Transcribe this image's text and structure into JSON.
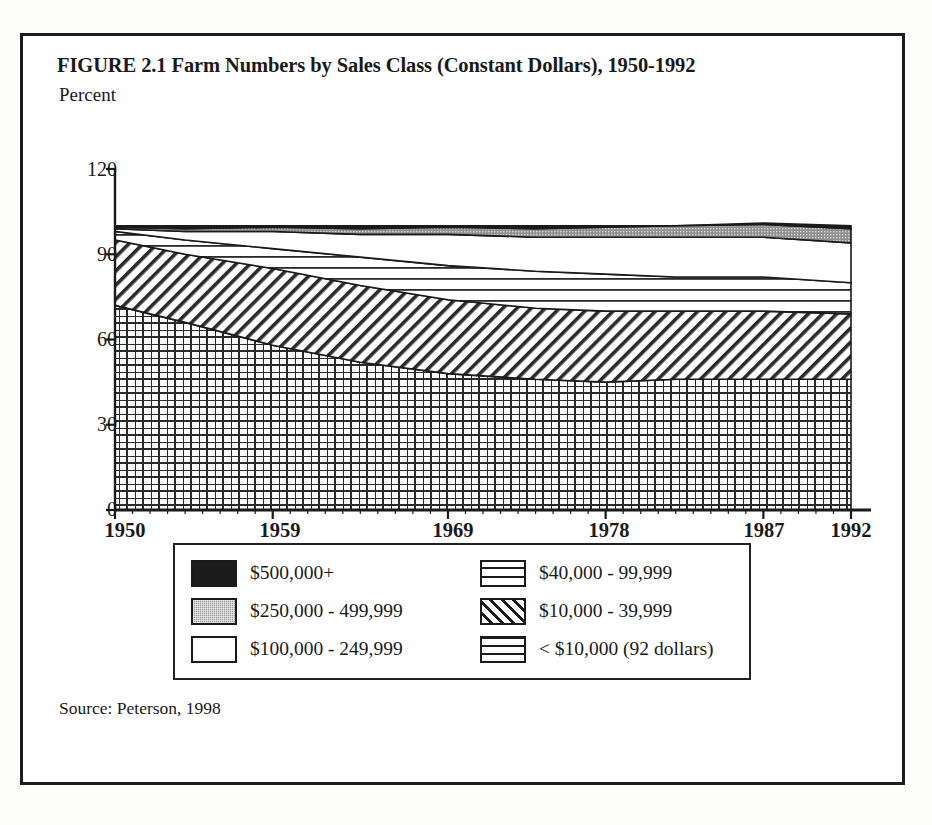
{
  "page": {
    "top_artifact_text": "",
    "figure_title": "FIGURE 2.1  Farm Numbers by Sales Class (Constant Dollars), 1950-1992",
    "axis_unit_label": "Percent",
    "source": "Source: Peterson, 1998",
    "frame_color": "#1d1d1d",
    "background_color": "#ffffff"
  },
  "chart_data": {
    "type": "area",
    "stacked": true,
    "title": "FIGURE 2.1  Farm Numbers by Sales Class (Constant Dollars), 1950-1992",
    "subtitle": "",
    "xlabel": "",
    "ylabel": "Percent",
    "ylim": [
      0,
      120
    ],
    "xlim": [
      1950,
      1992
    ],
    "grid": false,
    "legend_position": "below-plot",
    "y_ticks": [
      0,
      30,
      60,
      90,
      120
    ],
    "x_ticks": [
      1950,
      1959,
      1969,
      1978,
      1987,
      1992
    ],
    "x": [
      1950,
      1954,
      1959,
      1964,
      1969,
      1974,
      1978,
      1982,
      1987,
      1992
    ],
    "series": [
      {
        "name": "< $10,000 (92 dollars)",
        "pattern": "grid",
        "values": [
          72,
          66,
          58,
          52,
          48,
          46,
          45,
          46,
          46,
          46
        ]
      },
      {
        "name": "$10,000 - 39,999",
        "pattern": "diagonal",
        "values": [
          23,
          24,
          27,
          27,
          26,
          25,
          25,
          24,
          24,
          23
        ]
      },
      {
        "name": "$40,000 - 99,999",
        "pattern": "horizontal-lines",
        "values": [
          3,
          5,
          7,
          10,
          12,
          13,
          13,
          12,
          12,
          11
        ]
      },
      {
        "name": "$100,000 - 249,999",
        "pattern": "blank",
        "values": [
          1,
          3,
          6,
          8,
          11,
          12,
          13,
          14,
          14,
          14
        ]
      },
      {
        "name": "$250,000 - 499,999",
        "pattern": "gray",
        "values": [
          0.5,
          1,
          1.5,
          2,
          2.5,
          3,
          3.5,
          4,
          4.5,
          5
        ]
      },
      {
        "name": "$500,000+",
        "pattern": "solid-black",
        "values": [
          0.5,
          1,
          0.5,
          1,
          0.5,
          1,
          0.5,
          0,
          0.5,
          1
        ]
      }
    ],
    "legend": [
      {
        "label": "$500,000+",
        "pattern": "solid-black"
      },
      {
        "label": "$250,000 - 499,999",
        "pattern": "gray"
      },
      {
        "label": "$100,000 - 249,999",
        "pattern": "blank"
      },
      {
        "label": "$40,000 - 99,999",
        "pattern": "horizontal-lines"
      },
      {
        "label": "$10,000 - 39,999",
        "pattern": "diagonal"
      },
      {
        "label": "< $10,000 (92 dollars)",
        "pattern": "grid"
      }
    ]
  }
}
